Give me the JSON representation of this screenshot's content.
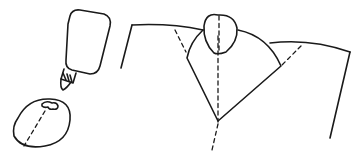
{
  "illustration": {
    "description": "Craft step diagram: glue bottle, paper circle with glue dot and fold line, and folded paper collar with round head",
    "ink_color": "#1a1a1a",
    "background_color": "#ffffff",
    "parts": [
      {
        "name": "glue-bottle",
        "label": ""
      },
      {
        "name": "paper-circle",
        "label": ""
      },
      {
        "name": "folded-paper-collar",
        "label": ""
      }
    ]
  }
}
